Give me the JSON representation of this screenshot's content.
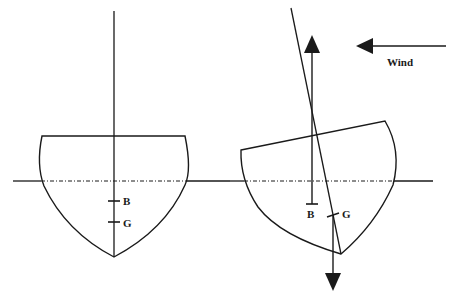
{
  "figure": {
    "colors": {
      "ink": "#1a1a1a",
      "background": "#ffffff"
    }
  },
  "upright_hull": {
    "labels": {
      "buoyancy": "B",
      "gravity": "G"
    }
  },
  "heeled_hull": {
    "labels": {
      "buoyancy": "B",
      "gravity": "G"
    }
  },
  "wind": {
    "label": "Wind",
    "direction": "left"
  }
}
